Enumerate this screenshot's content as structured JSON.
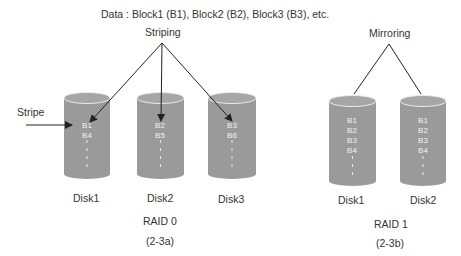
{
  "header": {
    "data_legend": "Data : Block1 (B1), Block2 (B2), Block3 (B3), etc."
  },
  "raid0": {
    "concept_label": "Striping",
    "stripe_label": "Stripe",
    "title": "RAID 0",
    "caption": "(2-3a)",
    "disks": [
      {
        "name": "Disk1",
        "blocks": [
          "B1",
          "B4"
        ]
      },
      {
        "name": "Disk2",
        "blocks": [
          "B2",
          "B5"
        ]
      },
      {
        "name": "Disk3",
        "blocks": [
          "B3",
          "B6"
        ]
      }
    ]
  },
  "raid1": {
    "concept_label": "Mirroring",
    "title": "RAID 1",
    "caption": "(2-3b)",
    "disks": [
      {
        "name": "Disk1",
        "blocks": [
          "B1",
          "B2",
          "B3",
          "B4"
        ]
      },
      {
        "name": "Disk2",
        "blocks": [
          "B1",
          "B2",
          "B3",
          "B4"
        ]
      }
    ]
  },
  "colors": {
    "cylinder": "#9a9a9a",
    "cylinder_top": "#a8a8a8",
    "rim": "#e8e8e8",
    "line": "#222222"
  }
}
